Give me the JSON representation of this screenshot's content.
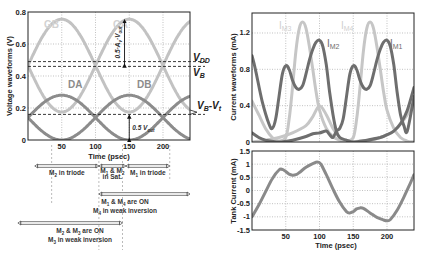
{
  "chart_data": [
    {
      "type": "line",
      "title": "",
      "xlabel": "Time (psec)",
      "ylabel": "Voltage waveforms (V)",
      "xlim": [
        0,
        240
      ],
      "ylim": [
        0,
        0.8
      ],
      "xticks": [
        50,
        100,
        150,
        200
      ],
      "yticks": [
        0,
        0.2,
        0.4,
        0.6,
        0.8
      ],
      "grid": true,
      "series": [
        {
          "name": "GB",
          "color": "#c2c2c2",
          "offset": 0.465,
          "amplitude": 0.29,
          "period": 200,
          "peak_t": 50
        },
        {
          "name": "GA",
          "color": "#c2c2c2",
          "offset": 0.465,
          "amplitude": 0.29,
          "period": 200,
          "peak_t": 150
        },
        {
          "name": "DA",
          "color": "#8c8c8c",
          "offset": 0.14,
          "amplitude": 0.14,
          "period": 200,
          "peak_t": 50
        },
        {
          "name": "DB",
          "color": "#8c8c8c",
          "offset": 0.14,
          "amplitude": 0.14,
          "period": 200,
          "peak_t": 150
        }
      ],
      "reference_lines": [
        {
          "name": "V_DD",
          "label": "V",
          "sub": "DD",
          "y": 0.49
        },
        {
          "name": "V_B",
          "label": "V",
          "sub": "B",
          "y": 0.46
        },
        {
          "name": "V_B-V_t",
          "label": "V",
          "sub": "B",
          "label2": "-V",
          "sub2": "t",
          "y": 0.16
        }
      ],
      "annotations": [
        {
          "text": "0.5·A",
          "sub": "v",
          "text2": "·V",
          "sub2": "out",
          "kind": "vertical-arrow",
          "t": 143,
          "y_from": 0.465,
          "y_to": 0.755
        },
        {
          "text": "0.5 V",
          "sub": "out",
          "kind": "vertical-arrow",
          "t": 150,
          "y_from": 0.0,
          "y_to": 0.16
        }
      ],
      "region_markers": [
        {
          "text": "M",
          "sub": "2",
          "text2": " in triode",
          "t_from": 10,
          "t_to": 105,
          "row": 0
        },
        {
          "text": "M",
          "sub": "1",
          "mid": " & M",
          "sub2": "2",
          "text2": "",
          "line2": "in Sat.",
          "t_from": 105,
          "t_to": 145,
          "row": 0,
          "small": true
        },
        {
          "text": "M",
          "sub": "1",
          "text2": " in triode",
          "t_from": 145,
          "t_to": 210,
          "row": 0
        },
        {
          "text": "M",
          "sub": "1",
          "mid": " & M",
          "sub2": "4",
          "text2": " are ON",
          "line2a": "M",
          "line2sub": "4",
          "line2b": " in weak inversion",
          "t_from": 105,
          "t_to": 240,
          "row": 1
        },
        {
          "text": "M",
          "sub": "2",
          "mid": " & M",
          "sub2": "3",
          "text2": " are ON",
          "line2a": "M",
          "line2sub": "3",
          "line2b": " in weak inversion",
          "t_from": -15,
          "t_to": 140,
          "row": 2
        }
      ]
    },
    {
      "type": "line",
      "title": "",
      "xlabel": "",
      "ylabel": "Current waveforms (mA)",
      "xlim": [
        0,
        240
      ],
      "ylim": [
        0,
        1.42
      ],
      "xticks": [
        50,
        100,
        150,
        200
      ],
      "yticks": [
        0,
        0.4,
        0.8,
        1.2
      ],
      "grid": true,
      "series": [
        {
          "name": "IM3",
          "label": "I",
          "sub": "M3",
          "color": "#c6c6c6",
          "points": [
            [
              0,
              0.45
            ],
            [
              10,
              0.3
            ],
            [
              20,
              0.15
            ],
            [
              30,
              0.05
            ],
            [
              40,
              0.01
            ],
            [
              50,
              0.05
            ],
            [
              55,
              0.25
            ],
            [
              60,
              0.6
            ],
            [
              65,
              1.0
            ],
            [
              70,
              1.25
            ],
            [
              75,
              1.32
            ],
            [
              80,
              1.25
            ],
            [
              85,
              1.05
            ],
            [
              90,
              0.8
            ],
            [
              95,
              0.55
            ],
            [
              100,
              0.35
            ],
            [
              110,
              0.15
            ],
            [
              120,
              0.06
            ],
            [
              130,
              0.02
            ],
            [
              140,
              0.0
            ],
            [
              150,
              0.0
            ],
            [
              160,
              0.01
            ],
            [
              175,
              0.02
            ],
            [
              190,
              0.05
            ],
            [
              200,
              0.08
            ],
            [
              210,
              0.12
            ],
            [
              220,
              0.2
            ],
            [
              230,
              0.3
            ],
            [
              240,
              0.45
            ]
          ]
        },
        {
          "name": "IM4",
          "label": "I",
          "sub": "M4",
          "color": "#c6c6c6",
          "points": [
            [
              0,
              0.0
            ],
            [
              20,
              0.02
            ],
            [
              40,
              0.05
            ],
            [
              60,
              0.1
            ],
            [
              80,
              0.18
            ],
            [
              90,
              0.28
            ],
            [
              100,
              0.4
            ],
            [
              110,
              0.3
            ],
            [
              120,
              0.15
            ],
            [
              130,
              0.05
            ],
            [
              140,
              0.01
            ],
            [
              150,
              0.05
            ],
            [
              155,
              0.25
            ],
            [
              160,
              0.6
            ],
            [
              165,
              1.0
            ],
            [
              170,
              1.25
            ],
            [
              175,
              1.32
            ],
            [
              180,
              1.25
            ],
            [
              185,
              1.05
            ],
            [
              190,
              0.8
            ],
            [
              195,
              0.55
            ],
            [
              200,
              0.35
            ],
            [
              210,
              0.15
            ],
            [
              220,
              0.05
            ],
            [
              230,
              0.01
            ],
            [
              240,
              0.0
            ]
          ]
        },
        {
          "name": "IM2",
          "label": "I",
          "sub": "M2",
          "color": "#6e6e6e",
          "points": [
            [
              0,
              0.95
            ],
            [
              5,
              0.8
            ],
            [
              15,
              0.45
            ],
            [
              25,
              0.2
            ],
            [
              30,
              0.15
            ],
            [
              35,
              0.25
            ],
            [
              40,
              0.5
            ],
            [
              45,
              0.75
            ],
            [
              50,
              0.84
            ],
            [
              55,
              0.8
            ],
            [
              60,
              0.68
            ],
            [
              65,
              0.6
            ],
            [
              70,
              0.58
            ],
            [
              75,
              0.62
            ],
            [
              80,
              0.75
            ],
            [
              85,
              0.9
            ],
            [
              90,
              1.02
            ],
            [
              95,
              1.1
            ],
            [
              100,
              1.12
            ],
            [
              105,
              1.05
            ],
            [
              110,
              0.85
            ],
            [
              115,
              0.55
            ],
            [
              120,
              0.3
            ],
            [
              125,
              0.12
            ],
            [
              130,
              0.05
            ],
            [
              140,
              0.02
            ],
            [
              150,
              0.0
            ],
            [
              170,
              0.02
            ],
            [
              190,
              0.05
            ],
            [
              200,
              0.08
            ],
            [
              210,
              0.12
            ],
            [
              220,
              0.2
            ],
            [
              230,
              0.35
            ],
            [
              240,
              0.6
            ]
          ]
        },
        {
          "name": "IM1",
          "label": "I",
          "sub": "M1",
          "color": "#6e6e6e",
          "points": [
            [
              0,
              0.1
            ],
            [
              10,
              0.05
            ],
            [
              20,
              0.02
            ],
            [
              40,
              0.0
            ],
            [
              60,
              0.02
            ],
            [
              80,
              0.06
            ],
            [
              90,
              0.09
            ],
            [
              100,
              0.1
            ],
            [
              110,
              0.12
            ],
            [
              115,
              0.08
            ],
            [
              120,
              0.05
            ],
            [
              125,
              0.12
            ],
            [
              130,
              0.15
            ],
            [
              135,
              0.25
            ],
            [
              140,
              0.5
            ],
            [
              145,
              0.75
            ],
            [
              150,
              0.84
            ],
            [
              155,
              0.8
            ],
            [
              160,
              0.68
            ],
            [
              165,
              0.6
            ],
            [
              170,
              0.58
            ],
            [
              175,
              0.62
            ],
            [
              180,
              0.75
            ],
            [
              185,
              0.9
            ],
            [
              190,
              1.02
            ],
            [
              195,
              1.1
            ],
            [
              200,
              1.12
            ],
            [
              205,
              1.05
            ],
            [
              210,
              0.85
            ],
            [
              215,
              0.55
            ],
            [
              220,
              0.3
            ],
            [
              225,
              0.18
            ],
            [
              230,
              0.12
            ],
            [
              240,
              0.5
            ]
          ]
        }
      ]
    },
    {
      "type": "line",
      "title": "",
      "xlabel": "Time (psec)",
      "ylabel": "Tank Current (mA)",
      "xlim": [
        0,
        240
      ],
      "ylim": [
        -1.5,
        1.5
      ],
      "xticks": [
        50,
        100,
        150,
        200
      ],
      "yticks": [
        -1.5,
        -1,
        -0.5,
        0,
        0.5,
        1,
        1.5
      ],
      "grid": true,
      "series": [
        {
          "name": "Tank current",
          "color": "#8a8a8a",
          "points": [
            [
              0,
              -1.0
            ],
            [
              10,
              -0.55
            ],
            [
              20,
              -0.05
            ],
            [
              30,
              0.45
            ],
            [
              40,
              0.78
            ],
            [
              45,
              0.8
            ],
            [
              50,
              0.72
            ],
            [
              55,
              0.62
            ],
            [
              60,
              0.58
            ],
            [
              65,
              0.6
            ],
            [
              70,
              0.68
            ],
            [
              80,
              0.88
            ],
            [
              90,
              1.02
            ],
            [
              97,
              1.08
            ],
            [
              102,
              1.0
            ],
            [
              110,
              0.6
            ],
            [
              120,
              0.05
            ],
            [
              130,
              -0.45
            ],
            [
              140,
              -0.8
            ],
            [
              145,
              -0.85
            ],
            [
              150,
              -0.8
            ],
            [
              155,
              -0.7
            ],
            [
              160,
              -0.66
            ],
            [
              165,
              -0.68
            ],
            [
              175,
              -0.85
            ],
            [
              185,
              -1.02
            ],
            [
              195,
              -1.12
            ],
            [
              200,
              -1.15
            ],
            [
              205,
              -1.1
            ],
            [
              215,
              -0.75
            ],
            [
              225,
              -0.25
            ],
            [
              235,
              0.3
            ],
            [
              240,
              0.6
            ]
          ]
        }
      ]
    }
  ]
}
